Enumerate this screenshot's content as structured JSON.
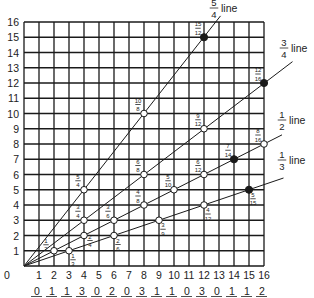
{
  "chart_data": {
    "type": "line",
    "title": "",
    "xlabel": "",
    "ylabel": "",
    "xlim": [
      0,
      16
    ],
    "ylim": [
      0,
      16
    ],
    "grid": true,
    "x_ticks": [
      0,
      1,
      2,
      3,
      4,
      5,
      6,
      7,
      8,
      9,
      10,
      11,
      12,
      13,
      14,
      15,
      16
    ],
    "y_ticks": [
      0,
      1,
      2,
      3,
      4,
      5,
      6,
      7,
      8,
      9,
      10,
      11,
      12,
      13,
      14,
      15,
      16
    ],
    "series": [
      {
        "name": "5/4 line",
        "label_num": "5",
        "label_den": "4",
        "slope": 1.25,
        "points": [
          {
            "x": 4,
            "y": 5,
            "label_num": "5",
            "label_den": "4",
            "filled": false
          },
          {
            "x": 8,
            "y": 10,
            "label_num": "10",
            "label_den": "8",
            "filled": false
          },
          {
            "x": 12,
            "y": 15,
            "label_num": "15",
            "label_den": "12",
            "filled": true
          }
        ]
      },
      {
        "name": "3/4 line",
        "label_num": "3",
        "label_den": "4",
        "slope": 0.75,
        "points": [
          {
            "x": 4,
            "y": 3,
            "label_num": "3",
            "label_den": "4",
            "filled": false
          },
          {
            "x": 8,
            "y": 6,
            "label_num": "6",
            "label_den": "8",
            "filled": false
          },
          {
            "x": 12,
            "y": 9,
            "label_num": "9",
            "label_den": "12",
            "filled": false
          },
          {
            "x": 16,
            "y": 12,
            "label_num": "12",
            "label_den": "16",
            "filled": true
          }
        ]
      },
      {
        "name": "1/2 line",
        "label_num": "1",
        "label_den": "2",
        "slope": 0.5,
        "points": [
          {
            "x": 2,
            "y": 1,
            "label_num": "1",
            "label_den": "2",
            "filled": false
          },
          {
            "x": 4,
            "y": 2,
            "label_num": "2",
            "label_den": "4",
            "filled": false
          },
          {
            "x": 6,
            "y": 3,
            "label_num": "3",
            "label_den": "6",
            "filled": false
          },
          {
            "x": 8,
            "y": 4,
            "label_num": "4",
            "label_den": "8",
            "filled": false
          },
          {
            "x": 10,
            "y": 5,
            "label_num": "5",
            "label_den": "10",
            "filled": false
          },
          {
            "x": 12,
            "y": 6,
            "label_num": "6",
            "label_den": "12",
            "filled": false
          },
          {
            "x": 14,
            "y": 7,
            "label_num": "7",
            "label_den": "14",
            "filled": true
          },
          {
            "x": 16,
            "y": 8,
            "label_num": "8",
            "label_den": "16",
            "filled": false
          }
        ]
      },
      {
        "name": "1/3 line",
        "label_num": "1",
        "label_den": "3",
        "slope": 0.3333,
        "points": [
          {
            "x": 3,
            "y": 1,
            "label_num": "1",
            "label_den": "3",
            "filled": false
          },
          {
            "x": 6,
            "y": 2,
            "label_num": "2",
            "label_den": "6",
            "filled": false
          },
          {
            "x": 9,
            "y": 3,
            "label_num": "3",
            "label_den": "9",
            "filled": false
          },
          {
            "x": 12,
            "y": 4,
            "label_num": "4",
            "label_den": "12",
            "filled": false
          },
          {
            "x": 15,
            "y": 5,
            "label_num": "5",
            "label_den": "15",
            "filled": true
          }
        ]
      }
    ],
    "line_word": "line",
    "answer_row": [
      "0",
      "1",
      "1",
      "3",
      "0",
      "2",
      "0",
      "3",
      "1",
      "1",
      "0",
      "3",
      "0",
      "1",
      "1",
      "2"
    ]
  },
  "colors": {
    "grid": "#1a1a1a",
    "line": "#1a1a1a",
    "text": "#222222",
    "background": "#ffffff"
  }
}
